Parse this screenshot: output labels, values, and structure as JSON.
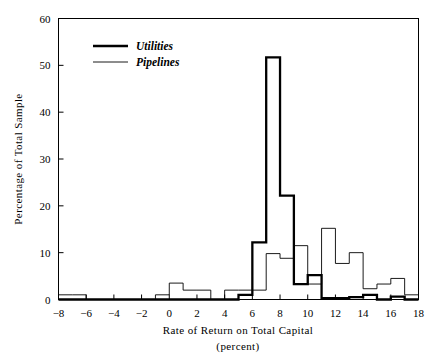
{
  "figure": {
    "background_color": "#ffffff",
    "ink_color": "#000000"
  },
  "axes": {
    "x": {
      "label_line1": "Rate of Return on Total Capital",
      "label_line2": "(percent)",
      "ticks": [
        "−8",
        "−6",
        "−4",
        "−2",
        "0",
        "2",
        "4",
        "6",
        "8",
        "10",
        "12",
        "14",
        "16",
        "18"
      ],
      "min": -8,
      "max": 18
    },
    "y": {
      "label": "Percentage of Total Sample",
      "ticks": [
        "0",
        "10",
        "20",
        "30",
        "40",
        "50",
        "60"
      ],
      "min": 0,
      "max": 60
    }
  },
  "legend": {
    "position": "top-left-inside",
    "entries": [
      {
        "label": "Utilities",
        "style": "thick-line",
        "color": "#000000"
      },
      {
        "label": "Pipelines",
        "style": "thin-line",
        "color": "#000000"
      }
    ]
  },
  "chart_data": {
    "type": "bar",
    "subtype": "step-histogram",
    "title": "",
    "xlabel": "Rate of Return on Total Capital (percent)",
    "ylabel": "Percentage of Total Sample",
    "xlim": [
      -8,
      18
    ],
    "ylim": [
      0,
      60
    ],
    "xticks": [
      -8,
      -6,
      -4,
      -2,
      0,
      2,
      4,
      6,
      8,
      10,
      12,
      14,
      16,
      18
    ],
    "yticks": [
      0,
      10,
      20,
      30,
      40,
      50,
      60
    ],
    "grid": false,
    "bin_width": 1,
    "bin_edges": [
      -8,
      -7,
      -6,
      -5,
      -4,
      -3,
      -2,
      -1,
      0,
      1,
      2,
      3,
      4,
      5,
      6,
      7,
      8,
      9,
      10,
      11,
      12,
      13,
      14,
      15,
      16,
      17,
      18
    ],
    "series": [
      {
        "name": "Utilities",
        "line_weight": "thick",
        "color": "#000000",
        "values": [
          0,
          0,
          0,
          0,
          0,
          0,
          0,
          0,
          0,
          0,
          0,
          0,
          0,
          1.0,
          12.2,
          51.7,
          22.2,
          3.3,
          5.2,
          0.3,
          0.3,
          0.5,
          1.0,
          0,
          0.6,
          0
        ]
      },
      {
        "name": "Pipelines",
        "line_weight": "thin",
        "color": "#000000",
        "values": [
          1.0,
          1.0,
          0,
          0,
          0,
          0,
          0,
          1.0,
          3.5,
          2.0,
          2.0,
          0,
          2.0,
          2.0,
          2.0,
          9.8,
          8.8,
          11.5,
          3.3,
          15.2,
          7.7,
          10.0,
          2.3,
          3.3,
          4.5,
          1.0
        ]
      }
    ]
  }
}
